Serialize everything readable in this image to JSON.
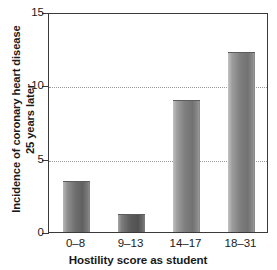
{
  "chart_data": {
    "type": "bar",
    "title": "",
    "xlabel": "Hostility score as student",
    "ylabel": "Incidence of coronary heart disease 25 years later",
    "ylabel_line1": "Incidence of coronary heart disease",
    "ylabel_line2": "25 years later",
    "categories": [
      "0–8",
      "9–13",
      "14–17",
      "18–31"
    ],
    "values": [
      3.5,
      1.2,
      9.0,
      12.3
    ],
    "ylim": [
      0,
      15
    ],
    "yticks": [
      0,
      5,
      10,
      15
    ],
    "ytick_labels": [
      "0",
      "5",
      "10",
      "15"
    ],
    "gridlines": [
      5,
      10
    ],
    "grid": "horizontal-dotted-at-5-and-10",
    "legend": "none",
    "bar_color": "#6e6e6e",
    "frame_color": "#3a3a3a",
    "background": "#ffffff"
  }
}
